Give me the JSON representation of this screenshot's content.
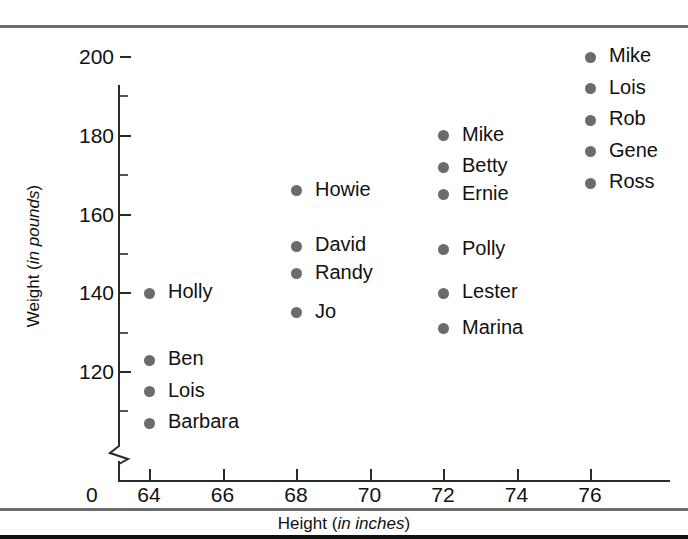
{
  "chart_data": {
    "type": "scatter",
    "title": "",
    "xlabel": "Height (in inches)",
    "xlabel_plain": "Height (",
    "xlabel_italic": "in inches",
    "xlabel_tail": ")",
    "ylabel": "Weight (in pounds)",
    "ylabel_plain": "Weight (",
    "ylabel_italic": "in pounds",
    "ylabel_tail": ")",
    "xlim": [
      63,
      78
    ],
    "ylim": [
      100,
      204
    ],
    "y_axis_break": true,
    "y_origin_label": "0",
    "grid": false,
    "legend": "none",
    "point_color": "#6b6b6b",
    "xticks": [
      64,
      66,
      68,
      70,
      72,
      74,
      76
    ],
    "xtick_labels": [
      "64",
      "66",
      "68",
      "70",
      "72",
      "74",
      "76"
    ],
    "yticks": [
      120,
      140,
      160,
      180,
      200
    ],
    "ytick_labels": [
      "120",
      "140",
      "160",
      "180",
      "200"
    ],
    "yticks_minor": [
      110,
      130,
      150,
      170,
      190
    ],
    "points": [
      {
        "label": "Holly",
        "x": 64,
        "y": 140
      },
      {
        "label": "Ben",
        "x": 64,
        "y": 123
      },
      {
        "label": "Lois",
        "x": 64,
        "y": 115
      },
      {
        "label": "Barbara",
        "x": 64,
        "y": 107
      },
      {
        "label": "Howie",
        "x": 68,
        "y": 166
      },
      {
        "label": "David",
        "x": 68,
        "y": 152
      },
      {
        "label": "Randy",
        "x": 68,
        "y": 145
      },
      {
        "label": "Jo",
        "x": 68,
        "y": 135
      },
      {
        "label": "Mike",
        "x": 72,
        "y": 180
      },
      {
        "label": "Betty",
        "x": 72,
        "y": 172
      },
      {
        "label": "Ernie",
        "x": 72,
        "y": 165
      },
      {
        "label": "Polly",
        "x": 72,
        "y": 151
      },
      {
        "label": "Lester",
        "x": 72,
        "y": 140
      },
      {
        "label": "Marina",
        "x": 72,
        "y": 131
      },
      {
        "label": "Mike",
        "x": 76,
        "y": 200
      },
      {
        "label": "Lois",
        "x": 76,
        "y": 192
      },
      {
        "label": "Rob",
        "x": 76,
        "y": 184
      },
      {
        "label": "Gene",
        "x": 76,
        "y": 176
      },
      {
        "label": "Ross",
        "x": 76,
        "y": 168
      }
    ]
  }
}
